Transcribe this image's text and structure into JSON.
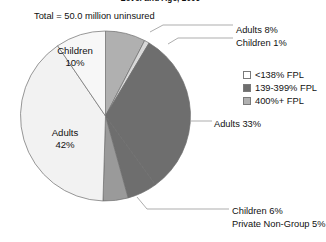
{
  "chart_title": "Level and Age, 2009",
  "total_note": "Total = 50.0 million uninsured",
  "legend": {
    "items": [
      {
        "label": "<138% FPL",
        "color": "#ffffff"
      },
      {
        "label": "139-399% FPL",
        "color": "#6e6e6e"
      },
      {
        "label": "400%+ FPL",
        "color": "#b0b0b0"
      }
    ]
  },
  "inner_labels": {
    "children": {
      "line1": "Children",
      "line2": "10%"
    },
    "adults": {
      "line1": "Adults",
      "line2": "42%"
    }
  },
  "callouts": {
    "adults_8": "Adults 8%",
    "children_1": "Children 1%",
    "adults_33": "Adults 33%",
    "children_6": "Children 6%",
    "private_5": "Private Non-Group 5%"
  },
  "chart_data": {
    "type": "pie",
    "title": "Level and Age, 2009",
    "subtitle": "Total = 50.0 million uninsured",
    "total_label": "Total = 50.0 million uninsured",
    "total_value": 50.0,
    "total_units": "million uninsured",
    "legend_position": "right",
    "start_angle_deg": 0,
    "direction": "clockwise",
    "labels": [
      "Adults 8%",
      "Children 1%",
      "Adults 33%",
      "Children 6%",
      "Private Non-Group 5%",
      "Adults 42%",
      "Children 10%"
    ],
    "categories": [
      "Adults 8%",
      "Children 1%",
      "Adults 33%",
      "Children 6%",
      "Private Non-Group 5%",
      "Adults 42%",
      "Children 10%"
    ],
    "values": [
      8,
      1,
      33,
      6,
      5,
      42,
      10
    ],
    "slices": [
      {
        "name": "Adults 8%",
        "group": "Adults",
        "value": 8,
        "fpl": "400%+ FPL",
        "color": "#b0b0b0",
        "label_type": "callout"
      },
      {
        "name": "Children 1%",
        "group": "Children",
        "value": 1,
        "fpl": "400%+ FPL",
        "color": "#d9d9d9",
        "label_type": "callout"
      },
      {
        "name": "Adults 33%",
        "group": "Adults",
        "value": 33,
        "fpl": "139-399% FPL",
        "color": "#6e6e6e",
        "label_type": "callout"
      },
      {
        "name": "Children 6%",
        "group": "Children",
        "value": 6,
        "fpl": "139-399% FPL",
        "color": "#6e6e6e",
        "label_type": "callout"
      },
      {
        "name": "Private Non-Group 5%",
        "group": "Private Non-Group",
        "value": 5,
        "fpl": "139-399% FPL",
        "color": "#9a9a9a",
        "label_type": "callout"
      },
      {
        "name": "Adults 42%",
        "group": "Adults",
        "value": 42,
        "fpl": "<138% FPL",
        "color": "#f2f2f2",
        "label_type": "inner"
      },
      {
        "name": "Children 10%",
        "group": "Children",
        "value": 10,
        "fpl": "<138% FPL",
        "color": "#f7f7f7",
        "label_type": "inner"
      }
    ],
    "units": "percent of total uninsured",
    "legend_entries": [
      "<138% FPL",
      "139-399% FPL",
      "400%+ FPL"
    ]
  }
}
